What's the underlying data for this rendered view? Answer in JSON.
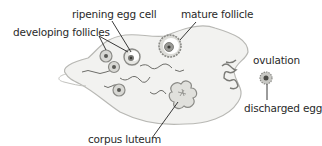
{
  "diagram": {
    "labels": {
      "ripening_egg_cell": "ripening egg cell",
      "developing_follicles": "developing follicles",
      "mature_follicle": "mature follicle",
      "ovulation": "ovulation",
      "discharged_egg": "discharged egg",
      "corpus_luteum": "corpus luteum"
    },
    "colors": {
      "ovary_fill": "#f2f2f0",
      "ovary_outline": "#b8b8b4",
      "follicle_ring": "#8a8a86",
      "follicle_core": "#5a5a56",
      "leader_line": "#222222",
      "text": "#2a2a2a"
    }
  }
}
